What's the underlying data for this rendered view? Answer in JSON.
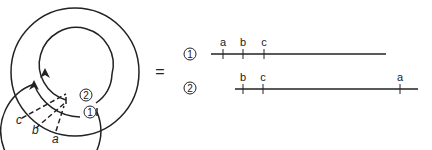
{
  "diagram": {
    "equals_sign": "=",
    "circle_labels": {
      "one": "1",
      "two": "2"
    },
    "cut_labels": [
      "c",
      "b",
      "a"
    ],
    "lines": [
      {
        "id": "1",
        "marks": [
          {
            "label": "a",
            "x": 223
          },
          {
            "label": "b",
            "x": 243
          },
          {
            "label": "c",
            "x": 264
          }
        ]
      },
      {
        "id": "2",
        "marks": [
          {
            "label": "b",
            "x": 243
          },
          {
            "label": "c",
            "x": 263
          },
          {
            "label": "a",
            "x": 400
          }
        ]
      }
    ]
  }
}
